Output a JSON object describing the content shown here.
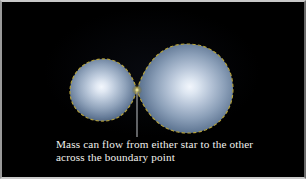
{
  "figure": {
    "background_color": "#000000",
    "frame_color": "#c9c9c9",
    "width": 306,
    "height": 179
  },
  "caption": {
    "line1": "Mass can flow from either star to the other",
    "line2": "across the boundary point",
    "text_color": "#f2f2ee"
  },
  "diagram": {
    "pointer_line_color": "#b9bcc0",
    "lobe_outline_color": "#b5a23c",
    "star_surface_center_color": "#e6ecf6",
    "star_surface_edge_color": "#44566e",
    "left_star": {
      "name": "smaller-star",
      "center_x": 103,
      "center_y": 90,
      "radius_x": 33,
      "radius_y": 31
    },
    "right_star": {
      "name": "larger-star",
      "center_x": 187,
      "center_y": 88,
      "radius_x": 47,
      "radius_y": 45
    },
    "boundary_point": {
      "name": "inner-lagrange-point",
      "x": 137,
      "y": 90,
      "label": "boundary point"
    },
    "pointer": {
      "from_x": 137,
      "from_y": 92,
      "to_x": 137,
      "to_y": 137
    }
  }
}
